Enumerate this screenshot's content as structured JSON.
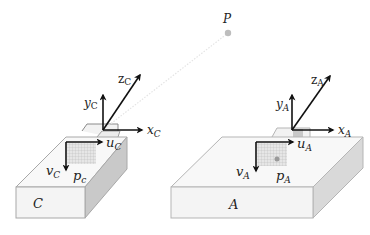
{
  "point": {
    "label": "P",
    "color": "#bdbdbd"
  },
  "camera": {
    "box_label": "C",
    "frame": {
      "x_label": "x",
      "x_sub": "C",
      "y_label": "y",
      "y_sub": "C",
      "z_label": "z",
      "z_sub": "C"
    },
    "image": {
      "u_label": "u",
      "u_sub": "C",
      "v_label": "v",
      "v_sub": "C",
      "p_label": "p",
      "p_sub": "c"
    }
  },
  "ar_device": {
    "box_label": "A",
    "frame": {
      "x_label": "x",
      "x_sub": "A",
      "y_label": "y",
      "y_sub": "A",
      "z_label": "z",
      "z_sub": "A"
    },
    "image": {
      "u_label": "u",
      "u_sub": "A",
      "v_label": "v",
      "v_sub": "A",
      "p_label": "p",
      "p_sub": "A"
    }
  },
  "colors": {
    "box_face": "#f4f4f4",
    "box_top": "#f8f8f8",
    "box_side_c": "#c9c9c9",
    "box_side_a": "#d9d9d9",
    "box_edge": "#a8a8a8",
    "axis": "#111111",
    "grid": "#b0b0b0"
  }
}
